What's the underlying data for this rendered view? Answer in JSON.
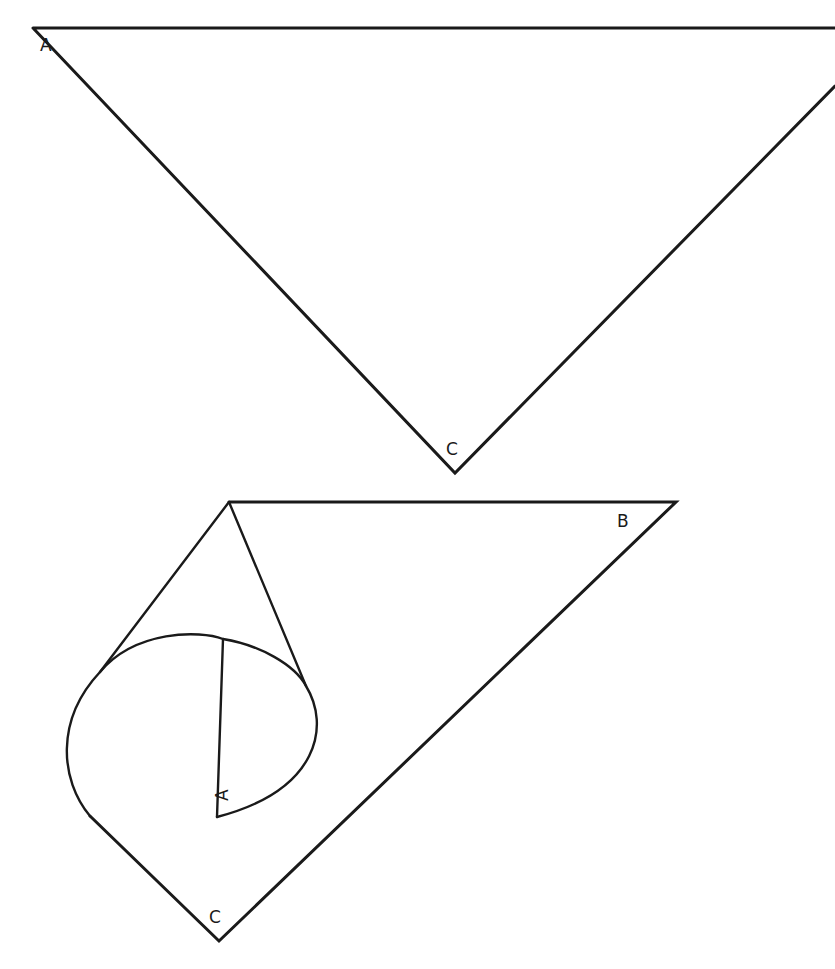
{
  "diagram": {
    "top_figure": {
      "description": "Triangle ABC (B off-canvas right)",
      "labels": {
        "A": "A",
        "C": "C"
      }
    },
    "bottom_figure": {
      "description": "Folded triangle: vertex A rolled into a cone with circular base",
      "labels": {
        "A": "A",
        "B": "B",
        "C": "C"
      }
    },
    "stroke_color": "#1a1a1a",
    "background": "#ffffff"
  }
}
